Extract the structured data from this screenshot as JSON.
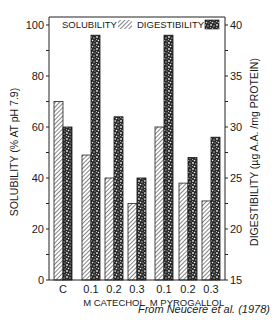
{
  "chart_data": {
    "type": "bar",
    "title": "",
    "categories": [
      "C",
      "0.1",
      "0.2",
      "0.3",
      "0.1",
      "0.2",
      "0.3"
    ],
    "category_groups": [
      {
        "label": "",
        "categories": [
          "C"
        ]
      },
      {
        "label": "M CATECHOL",
        "categories": [
          "0.1",
          "0.2",
          "0.3"
        ]
      },
      {
        "label": "M PYROGALLOL",
        "categories": [
          "0.1",
          "0.2",
          "0.3"
        ]
      }
    ],
    "series": [
      {
        "name": "SOLUBILITY",
        "axis": "left",
        "pattern": "hatched",
        "values": [
          70,
          49,
          40,
          30,
          60,
          38,
          31
        ]
      },
      {
        "name": "DIGESTIBILITY",
        "axis": "right",
        "pattern": "stippled",
        "values": [
          30,
          39,
          31,
          25,
          39,
          27,
          29
        ]
      }
    ],
    "xlabel": "",
    "ylabel": "SOLUBILITY (% AT pH 7.9)",
    "ylim": [
      0,
      100
    ],
    "yticks": [
      0,
      20,
      40,
      60,
      80,
      100
    ],
    "y2label": "DIGESTIBILITY (µg A.A. /mg PROTEIN)",
    "y2lim": [
      15,
      40
    ],
    "y2ticks": [
      15,
      20,
      25,
      30,
      35,
      40
    ],
    "legend_position": "top inside",
    "grid": false,
    "annotation": "From Neucere et al. (1978)"
  },
  "labels": {
    "legend_solubility": "SOLUBILITY",
    "legend_digestibility": "DIGESTIBILITY",
    "left_axis": "SOLUBILITY (% AT pH 7.9)",
    "right_axis": "DIGESTIBILITY (µg A.A. /mg PROTEIN)",
    "group_catechol": "M CATECHOL",
    "group_pyrogallol": "M PYROGALLOL",
    "credit": "From Neucere et al. (1978)"
  }
}
